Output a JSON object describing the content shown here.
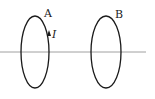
{
  "diagram": {
    "axis": {
      "x1": 0,
      "y1": 52,
      "x2": 146,
      "y2": 52,
      "color": "#888888"
    },
    "loops": [
      {
        "id": "A",
        "label": "A",
        "cx": 35,
        "cy": 52,
        "rx": 14,
        "ry": 36,
        "label_x": 44,
        "label_y": 17
      },
      {
        "id": "B",
        "label": "B",
        "cx": 106,
        "cy": 52,
        "rx": 15,
        "ry": 36,
        "label_x": 115,
        "label_y": 18
      }
    ],
    "current": {
      "label": "I",
      "loop": "A",
      "direction": "up",
      "label_x": 52,
      "label_y": 38
    },
    "colors": {
      "loop": "#1a1a1a",
      "axis": "#888888",
      "text": "#222222"
    }
  }
}
